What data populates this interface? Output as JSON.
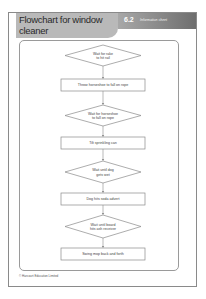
{
  "header": {
    "title": "Flowchart for window cleaner",
    "section_number": "6.2",
    "section_label": "Information sheet"
  },
  "flowchart": {
    "steps": [
      {
        "type": "decision",
        "text_lines": [
          "Wait for rake",
          "to hit rail"
        ]
      },
      {
        "type": "process",
        "text_lines": [
          "Throw horseshoe to fall on rope"
        ]
      },
      {
        "type": "decision",
        "text_lines": [
          "Wait for horseshoe",
          "to fall on rope"
        ]
      },
      {
        "type": "process",
        "text_lines": [
          "Tilt sprinkling can"
        ]
      },
      {
        "type": "decision",
        "text_lines": [
          "Wait until dog",
          "gets wet"
        ]
      },
      {
        "type": "process",
        "text_lines": [
          "Dog hits soda advert"
        ]
      },
      {
        "type": "decision",
        "text_lines": [
          "Wait until board",
          "hits ash receiver"
        ]
      },
      {
        "type": "process",
        "text_lines": [
          "Swing mop back and forth"
        ]
      }
    ]
  },
  "footer": {
    "copyright": "© Harcourt Education Limited"
  },
  "colors": {
    "header_tab": "#b9b9b9",
    "band_dark": "#6e6e6e",
    "line": "#8a8a8a"
  }
}
